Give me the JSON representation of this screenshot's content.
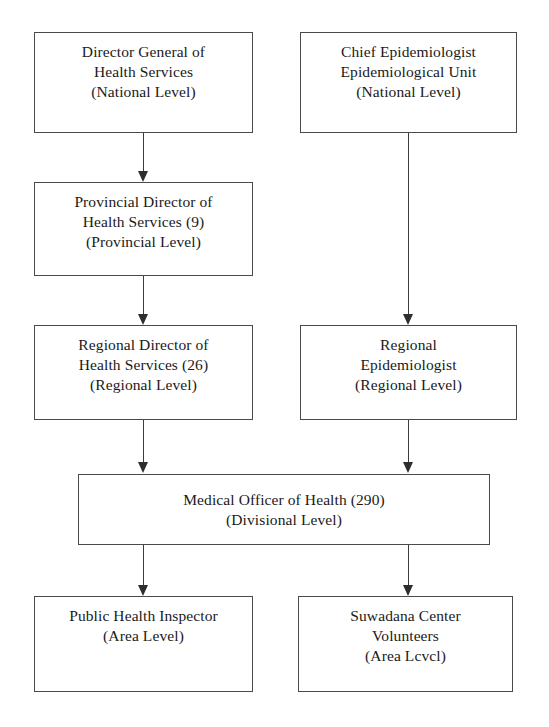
{
  "diagram": {
    "type": "flowchart",
    "orientation": "top-down",
    "background_color": "#ffffff",
    "line_color": "#3c3c3c",
    "text_color": "#1a1a1a"
  },
  "nodes": [
    {
      "id": "director-general",
      "column": "left",
      "level": "national",
      "lines": [
        "Director General of",
        "Health Services",
        "(National Level)"
      ],
      "line1": "Director General of",
      "line2": "Health Services",
      "line3": "(National Level)"
    },
    {
      "id": "chief-epidemiologist",
      "column": "right",
      "level": "national",
      "lines": [
        "Chief Epidemiologist",
        "Epidemiological Unit",
        "(National Level)"
      ],
      "line1": "Chief Epidemiologist",
      "line2": "Epidemiological Unit",
      "line3": "(National Level)"
    },
    {
      "id": "provincial-director",
      "column": "left",
      "level": "provincial",
      "count": 9,
      "lines": [
        "Provincial Director of",
        "Health Services (9)",
        "(Provincial Level)"
      ],
      "line1": "Provincial Director of",
      "line2": "Health Services (9)",
      "line3": "(Provincial Level)"
    },
    {
      "id": "regional-director",
      "column": "left",
      "level": "regional",
      "count": 26,
      "lines": [
        "Regional Director of",
        "Health Services (26)",
        "(Regional Level)"
      ],
      "line1": "Regional Director of",
      "line2": "Health Services (26)",
      "line3": "(Regional Level)"
    },
    {
      "id": "regional-epidemiologist",
      "column": "right",
      "level": "regional",
      "lines": [
        "Regional",
        "Epidemiologist",
        "(Regional Level)"
      ],
      "line1": "Regional",
      "line2": "Epidemiologist",
      "line3": "(Regional Level)"
    },
    {
      "id": "medical-officer",
      "column": "span",
      "level": "divisional",
      "count": 290,
      "lines": [
        "Medical Officer of Health (290)",
        "(Divisional Level)"
      ],
      "line1": "Medical Officer of Health (290)",
      "line2": "(Divisional Level)"
    },
    {
      "id": "public-health-inspector",
      "column": "left",
      "level": "area",
      "lines": [
        "Public Health Inspector",
        "(Area Level)"
      ],
      "line1": "Public Health Inspector",
      "line2": "(Area Level)"
    },
    {
      "id": "suwadana-volunteers",
      "column": "right",
      "level": "area",
      "lines": [
        "Suwadana Center",
        "Volunteers",
        "(Area Lcvcl)"
      ],
      "line1": "Suwadana Center",
      "line2": "Volunteers",
      "line3": "(Area Lcvcl)"
    }
  ],
  "edges": [
    {
      "id": "e1",
      "from": "director-general",
      "to": "provincial-director"
    },
    {
      "id": "e2",
      "from": "provincial-director",
      "to": "regional-director"
    },
    {
      "id": "e3",
      "from": "chief-epidemiologist",
      "to": "regional-epidemiologist"
    },
    {
      "id": "e4",
      "from": "regional-director",
      "to": "medical-officer"
    },
    {
      "id": "e5",
      "from": "regional-epidemiologist",
      "to": "medical-officer"
    },
    {
      "id": "e6",
      "from": "medical-officer",
      "to": "public-health-inspector"
    },
    {
      "id": "e7",
      "from": "medical-officer",
      "to": "suwadana-volunteers"
    }
  ]
}
